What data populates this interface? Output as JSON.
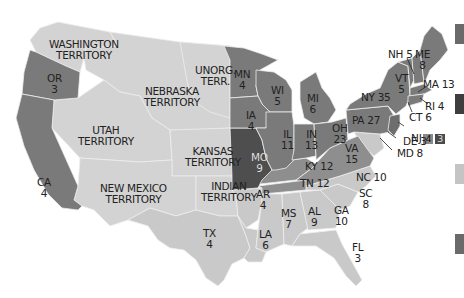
{
  "colors": {
    "free_state": "#7a7a7a",
    "free_state_dark": "#6e6e6e",
    "border_state": "#8e8e8e",
    "mo": "#4e4e4e",
    "slave_state": "#c9c9c9",
    "territory": "#d3d3d3",
    "border_lines": "#eeeeee",
    "water": "#ffffff"
  },
  "territories": [
    {
      "id": "washington",
      "label": "WASHINGTON\nTERRITORY"
    },
    {
      "id": "nebraska",
      "label": "NEBRASKA\nTERRITORY"
    },
    {
      "id": "unorg",
      "label": "UNORG.\nTERR."
    },
    {
      "id": "utah",
      "label": "UTAH\nTERRITORY"
    },
    {
      "id": "kansas",
      "label": "KANSAS\nTERRITORY"
    },
    {
      "id": "newmexico",
      "label": "NEW MEXICO\nTERRITORY"
    },
    {
      "id": "indian",
      "label": "INDIAN\nTERRITORY"
    }
  ],
  "states": [
    {
      "abbr": "OR",
      "votes": "3",
      "label": "OR\n3"
    },
    {
      "abbr": "CA",
      "votes": "4",
      "label": "CA\n4"
    },
    {
      "abbr": "MN",
      "votes": "4",
      "label": "MN\n4"
    },
    {
      "abbr": "WI",
      "votes": "5",
      "label": "WI\n5"
    },
    {
      "abbr": "MI",
      "votes": "6",
      "label": "MI\n6"
    },
    {
      "abbr": "IA",
      "votes": "4",
      "label": "IA\n4"
    },
    {
      "abbr": "IL",
      "votes": "11",
      "label": "IL\n11"
    },
    {
      "abbr": "IN",
      "votes": "13",
      "label": "IN\n13"
    },
    {
      "abbr": "OH",
      "votes": "23",
      "label": "OH\n23"
    },
    {
      "abbr": "PA",
      "votes": "27",
      "label": "PA 27"
    },
    {
      "abbr": "NY",
      "votes": "35",
      "label": "NY 35"
    },
    {
      "abbr": "VT",
      "votes": "5",
      "label": "VT\n5"
    },
    {
      "abbr": "NH",
      "votes": "5",
      "label": "NH 5"
    },
    {
      "abbr": "ME",
      "votes": "8",
      "label": "ME\n8"
    },
    {
      "abbr": "MA",
      "votes": "13",
      "label": "MA 13"
    },
    {
      "abbr": "RI",
      "votes": "4",
      "label": "RI 4"
    },
    {
      "abbr": "CT",
      "votes": "6",
      "label": "CT 6"
    },
    {
      "abbr": "NJ",
      "votes": "4 3",
      "label": "NJ",
      "split": [
        "4",
        "3"
      ]
    },
    {
      "abbr": "DE",
      "votes": "3",
      "label": "DE 3"
    },
    {
      "abbr": "MD",
      "votes": "8",
      "label": "MD 8"
    },
    {
      "abbr": "MO",
      "votes": "9",
      "label": "MO\n9"
    },
    {
      "abbr": "KY",
      "votes": "12",
      "label": "KY 12"
    },
    {
      "abbr": "VA",
      "votes": "15",
      "label": "VA\n15"
    },
    {
      "abbr": "TN",
      "votes": "12",
      "label": "TN 12"
    },
    {
      "abbr": "NC",
      "votes": "10",
      "label": "NC 10"
    },
    {
      "abbr": "SC",
      "votes": "8",
      "label": "SC\n8"
    },
    {
      "abbr": "AR",
      "votes": "4",
      "label": "AR\n4"
    },
    {
      "abbr": "MS",
      "votes": "7",
      "label": "MS\n7"
    },
    {
      "abbr": "AL",
      "votes": "9",
      "label": "AL\n9"
    },
    {
      "abbr": "GA",
      "votes": "10",
      "label": "GA\n10"
    },
    {
      "abbr": "LA",
      "votes": "6",
      "label": "LA\n6"
    },
    {
      "abbr": "TX",
      "votes": "4",
      "label": "TX\n4"
    },
    {
      "abbr": "FL",
      "votes": "3",
      "label": "FL\n3"
    }
  ],
  "legend": {
    "swatches": [
      {
        "color": "#6a6a6a"
      },
      {
        "color": "#3e3e3e"
      },
      {
        "color": "#c4c4c4"
      },
      {
        "color": "#6a6a6a"
      }
    ]
  }
}
